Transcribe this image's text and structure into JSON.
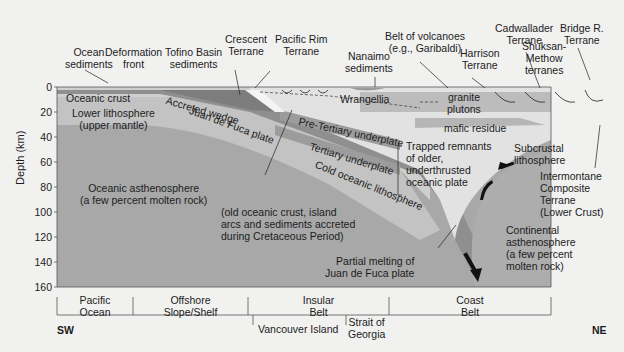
{
  "diagram": {
    "y_axis": {
      "label": "Depth (km)",
      "ticks": [
        "0",
        "20",
        "40",
        "60",
        "80",
        "100",
        "120",
        "140",
        "160"
      ]
    },
    "top_labels": {
      "ocean_sediments": "Ocean\nsediments",
      "deformation_front": "Deformation\nfront",
      "tofino_basin": "Tofino Basin\nsediments",
      "crescent_terrane": "Crescent\nTerrane",
      "pacific_rim_terrane": "Pacific Rim\nTerrane",
      "nanaimo_sediments": "Nanaimo\nsediments",
      "belt_of_volcanoes": "Belt of volcanoes\n(e.g., Garibaldi)",
      "harrison_terrane": "Harrison\nTerrane",
      "cadwallader_terrane": "Cadwallader\nTerrane",
      "shuksan_methow": "Shuksan-\nMethow\nterranes",
      "bridge_r_terrane": "Bridge R.\nTerrane"
    },
    "inner_labels": {
      "oceanic_crust": "Oceanic crust",
      "lower_lithosphere": "Lower lithosphere\n(upper mantle)",
      "accreted_wedge": "Accreted wedge",
      "juan_de_fuca": "Juan de Fuca plate",
      "wrangellia": "Wrangellia",
      "pre_tertiary": "Pre-Tertiary underplate",
      "tertiary": "Tertiary underplate",
      "cold_oceanic": "Cold oceanic lithosphere",
      "granite_plutons": "granite\nplutons",
      "mafic_residue": "mafic residue",
      "trapped_remnants": "Trapped remnants\nof older,\nunderthrusted\noceanic plate",
      "subcrustal": "Subcrustal\nlithosphere",
      "intermontane": "Intermontane\nComposite\nTerrane\n(Lower Crust)",
      "oceanic_asthenosphere": "Oceanic asthenosphere\n(a few percent molten rock)",
      "old_oceanic_crust": "(old oceanic crust, island\narcs and sediments accreted\nduring Cretaceous Period)",
      "partial_melting": "Partial melting of\nJuan de Fuca plate",
      "continental_asthenosphere": "Continental\nasthenosphere\n(a few percent\nmolten rock)"
    },
    "regions": [
      {
        "label": "Pacific\nOcean"
      },
      {
        "label": "Offshore\nSlope/Shelf"
      },
      {
        "label": "Insular\nBelt"
      },
      {
        "label": "Coast\nBelt"
      }
    ],
    "subregions": [
      {
        "label": "Vancouver Island"
      },
      {
        "label": "Strait of\nGeorgia"
      }
    ],
    "directions": {
      "left": "SW",
      "right": "NE"
    },
    "colors": {
      "background": "#f1f1f0",
      "asthenosphere": "#a9a9a9",
      "lithosphere": "#c8c8c8",
      "crust": "#8d8d8d",
      "light": "#e3e3e3",
      "continental": "#bdbdbd"
    }
  }
}
